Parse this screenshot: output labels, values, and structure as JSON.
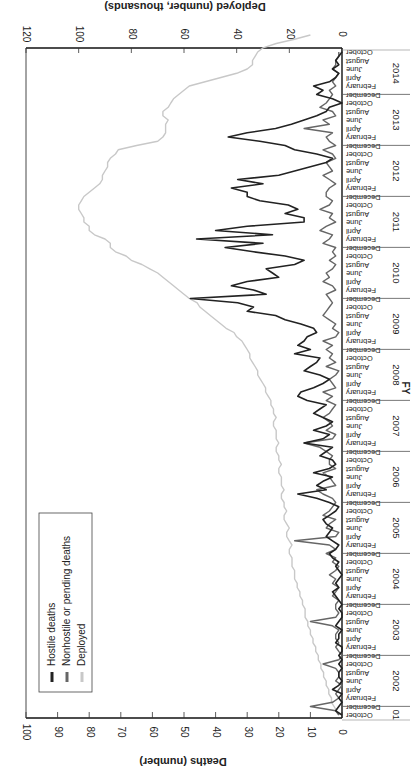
{
  "chart_data": {
    "type": "line",
    "orientation": "rotated (image rotated; time runs vertically bottom-to-top, values increase leftward)",
    "title": "",
    "xlabel": "FY",
    "ylabel": "Deaths (number)",
    "y2label": "Deployed (number, thousands)",
    "ylim": [
      0,
      100
    ],
    "y2lim": [
      0,
      120
    ],
    "yticks": [
      0,
      10,
      20,
      30,
      40,
      50,
      60,
      70,
      80,
      90,
      100
    ],
    "y2ticks": [
      0,
      20,
      40,
      60,
      80,
      100,
      120
    ],
    "fiscal_years": [
      "01",
      "2002",
      "2003",
      "2004",
      "2005",
      "2006",
      "2007",
      "2008",
      "2009",
      "2010",
      "2011",
      "2012",
      "2013",
      "2014"
    ],
    "month_labels": [
      "October",
      "December",
      "February",
      "April",
      "June",
      "August"
    ],
    "start": "October 2001",
    "end": "October 2014",
    "legend": [
      "Hostile deaths",
      "Nonhostile or pending deaths",
      "Deployed"
    ],
    "legend_position": "lower-left (rotated)",
    "grid": false,
    "series": [
      {
        "name": "Hostile deaths",
        "color": "#222222",
        "values": [
          0,
          2,
          1,
          0,
          1,
          0,
          3,
          1,
          0,
          1,
          1,
          0,
          1,
          0,
          1,
          0,
          0,
          2,
          1,
          1,
          0,
          2,
          1,
          0,
          0,
          1,
          0,
          1,
          2,
          3,
          1,
          2,
          1,
          0,
          1,
          2,
          1,
          3,
          4,
          2,
          1,
          3,
          5,
          4,
          3,
          5,
          6,
          4,
          2,
          1,
          4,
          8,
          14,
          5,
          8,
          6,
          3,
          9,
          4,
          2,
          3,
          7,
          5,
          3,
          12,
          6,
          4,
          9,
          5,
          3,
          6,
          9,
          7,
          5,
          11,
          14,
          13,
          9,
          6,
          4,
          7,
          12,
          10,
          8,
          7,
          15,
          10,
          14,
          12,
          11,
          8,
          9,
          13,
          18,
          21,
          30,
          28,
          33,
          48,
          24,
          28,
          35,
          30,
          20,
          22,
          24,
          15,
          12,
          18,
          28,
          37,
          25,
          46,
          22,
          40,
          30,
          12,
          12,
          18,
          14,
          17,
          26,
          30,
          30,
          35,
          25,
          33,
          20,
          15,
          10,
          5,
          3,
          8,
          15,
          18,
          26,
          36,
          30,
          21,
          16,
          12,
          8,
          5,
          4,
          0,
          3,
          8,
          6,
          9,
          4,
          2,
          1,
          3,
          1,
          2,
          1,
          0
        ]
      },
      {
        "name": "Nonhostile or pending deaths",
        "color": "#666666",
        "values": [
          1,
          2,
          10,
          3,
          1,
          2,
          1,
          0,
          2,
          1,
          1,
          2,
          6,
          1,
          0,
          1,
          2,
          1,
          2,
          2,
          1,
          3,
          10,
          2,
          1,
          2,
          2,
          1,
          3,
          2,
          1,
          3,
          2,
          4,
          2,
          1,
          3,
          2,
          5,
          2,
          4,
          15,
          2,
          1,
          5,
          4,
          2,
          6,
          4,
          3,
          2,
          3,
          6,
          8,
          2,
          3,
          4,
          6,
          2,
          4,
          4,
          3,
          5,
          7,
          12,
          3,
          2,
          5,
          3,
          4,
          6,
          4,
          3,
          2,
          5,
          3,
          6,
          2,
          3,
          4,
          2,
          1,
          5,
          2,
          4,
          3,
          5,
          3,
          6,
          2,
          1,
          3,
          2,
          4,
          6,
          5,
          4,
          3,
          4,
          5,
          2,
          3,
          6,
          4,
          5,
          3,
          2,
          4,
          2,
          3,
          2,
          6,
          4,
          3,
          7,
          5,
          2,
          4,
          3,
          7,
          4,
          3,
          5,
          5,
          4,
          2,
          4,
          6,
          3,
          4,
          5,
          2,
          3,
          6,
          2,
          4,
          5,
          3,
          12,
          4,
          6,
          2,
          3,
          7,
          5,
          4,
          3,
          4,
          2,
          3,
          2,
          1,
          3,
          2,
          2,
          1,
          1
        ]
      },
      {
        "name": "Deployed",
        "unit": "thousands",
        "color": "#c8c8c8",
        "values": [
          1,
          2,
          3,
          4,
          4,
          5,
          5,
          6,
          6,
          7,
          7,
          8,
          8,
          9,
          9,
          10,
          10,
          11,
          11,
          12,
          12,
          13,
          13,
          14,
          14,
          14,
          15,
          15,
          16,
          16,
          17,
          17,
          18,
          18,
          18,
          19,
          19,
          19,
          20,
          20,
          19,
          20,
          21,
          21,
          20,
          21,
          22,
          22,
          21,
          22,
          22,
          23,
          23,
          22,
          23,
          23,
          23,
          24,
          24,
          23,
          24,
          24,
          25,
          25,
          24,
          25,
          25,
          25,
          26,
          26,
          25,
          26,
          26,
          27,
          27,
          28,
          29,
          29,
          30,
          31,
          32,
          32,
          33,
          34,
          35,
          35,
          36,
          37,
          38,
          40,
          41,
          44,
          46,
          48,
          50,
          52,
          54,
          55,
          58,
          60,
          62,
          64,
          66,
          68,
          70,
          73,
          76,
          80,
          82,
          86,
          88,
          88,
          90,
          94,
          96,
          96,
          98,
          98,
          99,
          100,
          100,
          99,
          98,
          96,
          94,
          92,
          91,
          91,
          90,
          89,
          89,
          88,
          86,
          85,
          78,
          70,
          68,
          67,
          67,
          67,
          66,
          68,
          68,
          66,
          65,
          64,
          62,
          60,
          58,
          52,
          46,
          40,
          36,
          34,
          34,
          33,
          32,
          30,
          25,
          18,
          12
        ]
      }
    ]
  },
  "axes": {
    "top_title": "Deployed (number, thousands)",
    "bottom_title": "Deaths (number)",
    "fy_label": "FY"
  },
  "legend": {
    "items": [
      {
        "label": "Hostile deaths",
        "color": "#222222"
      },
      {
        "label": "Nonhostile or pending deaths",
        "color": "#666666"
      },
      {
        "label": "Deployed",
        "color": "#c8c8c8"
      }
    ]
  }
}
